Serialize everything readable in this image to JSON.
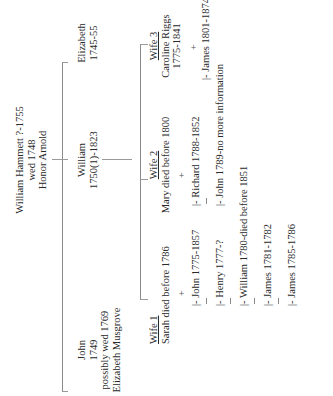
{
  "document": {
    "orientation": "rotated-90-ccw",
    "parents": {
      "line1": "William Hammett ?-1755",
      "line2": "wed 1748",
      "line3": "Honor Arnold"
    },
    "children": [
      {
        "name": "John",
        "years": "1749",
        "note1": "possibly wed 1769",
        "note2": "Elizabeth Musgrove"
      },
      {
        "name": "William",
        "years": "1750(1)-1823"
      },
      {
        "name": "Elizabeth",
        "years": "1745-55"
      }
    ],
    "wives": [
      {
        "label": "Wife 1",
        "detail": "Sarah died before 1786",
        "children": [
          "|- John 1775-1857",
          "|- Henry 1777-?",
          "|- William 1780-died before 1851",
          "|- James 1781-1782",
          "|- James 1785-1786"
        ]
      },
      {
        "label": "Wife 2",
        "detail": "Mary died before 1800",
        "children": [
          "|- Richard 1788-1852",
          "|- John 1789-no more information"
        ]
      },
      {
        "label": "Wife 3",
        "detail": "Caroline Riggs",
        "detail2": "1775-1841",
        "children": [
          "|- James 1801-1874"
        ]
      }
    ],
    "plus_sign": "+"
  }
}
